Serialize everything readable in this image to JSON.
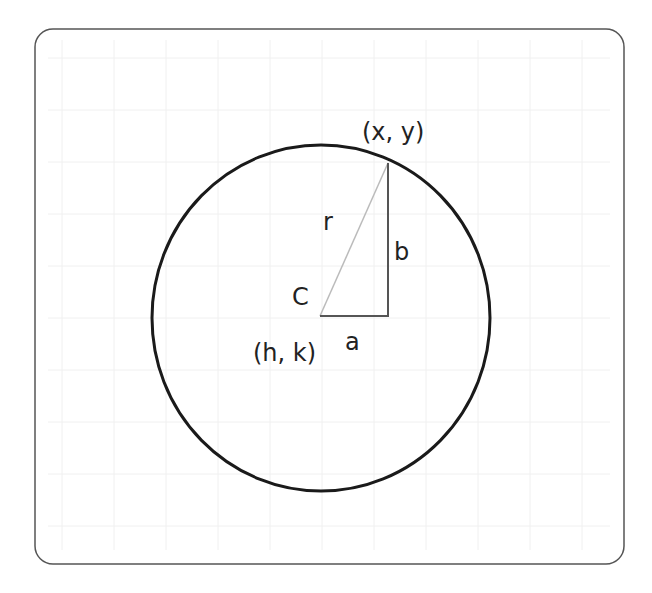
{
  "diagram": {
    "labels": {
      "point": "(x, y)",
      "radius": "r",
      "vertical_leg": "b",
      "center_letter": "C",
      "center_coords": "(h, k)",
      "horizontal_leg": "a"
    },
    "colors": {
      "circle": "#1a1a1a",
      "frame": "#555555",
      "legs": "#555555",
      "radius_line": "#bbbbbb",
      "grid": "#eeeeee"
    }
  }
}
